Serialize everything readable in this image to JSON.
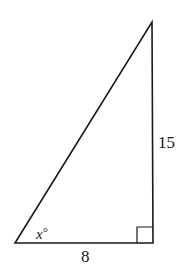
{
  "diagram": {
    "type": "right-triangle",
    "vertices": {
      "bottom_left": {
        "x": 15,
        "y": 243
      },
      "bottom_right": {
        "x": 153,
        "y": 243
      },
      "top": {
        "x": 152,
        "y": 22
      }
    },
    "right_angle_at": "bottom_right",
    "labels": {
      "right_side": "15",
      "bottom_side": "8",
      "angle_variable": "x",
      "angle_unit": "°"
    },
    "colors": {
      "stroke": "#1a1a1a",
      "background": "#ffffff"
    }
  }
}
